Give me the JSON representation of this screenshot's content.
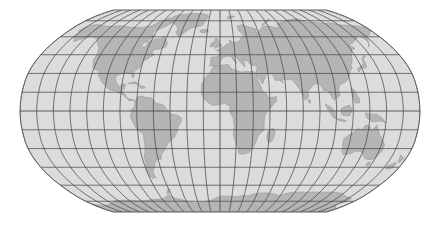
{
  "figure": {
    "name": "world-map",
    "background_color": "#ffffff",
    "width": 440,
    "height": 231
  },
  "map": {
    "projection": "Robinson",
    "central_meridian": 0,
    "extent_px": {
      "left": 20,
      "top": 10,
      "right": 420,
      "bottom": 212
    },
    "ocean_color": "#dcdcdc",
    "land_color": "#b5b5b5",
    "land_outline_color": "#8f8f8f",
    "graticule_color": "#4a4a4a",
    "border_color": "#5a5a5a",
    "graticule": {
      "meridian_interval_deg": 15,
      "parallel_interval_deg": 15,
      "meridian_labels": [
        "180W",
        "165W",
        "150W",
        "135W",
        "120W",
        "105W",
        "90W",
        "75W",
        "60W",
        "45W",
        "30W",
        "15W",
        "0",
        "15E",
        "30E",
        "45E",
        "60E",
        "75E",
        "90E",
        "105E",
        "120E",
        "135E",
        "150E",
        "165E",
        "180E"
      ],
      "parallel_labels": [
        "75N",
        "60N",
        "45N",
        "30N",
        "15N",
        "0",
        "15S",
        "30S",
        "45S",
        "60S",
        "75S"
      ],
      "lon_min": -180,
      "lon_max": 180,
      "lat_min": -90,
      "lat_max": 90
    },
    "landmasses": [
      "North America",
      "South America",
      "Greenland",
      "Europe",
      "Africa",
      "Asia",
      "Australia",
      "Antarctica",
      "Madagascar",
      "New Zealand",
      "Japan",
      "Indonesia",
      "British Isles",
      "Iceland"
    ]
  },
  "chart_data": {
    "type": "map",
    "projection": "Robinson",
    "xlabel": "Longitude",
    "ylabel": "Latitude",
    "xlim": [
      -180,
      180
    ],
    "ylim": [
      -90,
      90
    ],
    "grid": true,
    "legend": "none"
  }
}
